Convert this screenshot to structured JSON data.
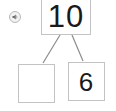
{
  "widget": {
    "type": "number-bond",
    "title": "Number bond",
    "audio_button": {
      "icon": "speaker-audio-icon",
      "label": "Play audio"
    },
    "whole": {
      "label": "10",
      "filled": true
    },
    "parts": [
      {
        "label": "",
        "filled": false,
        "placeholder": ""
      },
      {
        "label": "6",
        "filled": true
      }
    ],
    "colors": {
      "box_border": "#c3c3c3",
      "connector": "#8c8c8c",
      "text": "#1a1a1a",
      "background": "#ffffff",
      "icon_fill": "#f2f2f2",
      "icon_border": "#b9b9b9"
    },
    "connectors": [
      {
        "from": "whole",
        "to": "part-left"
      },
      {
        "from": "whole",
        "to": "part-right"
      }
    ]
  }
}
